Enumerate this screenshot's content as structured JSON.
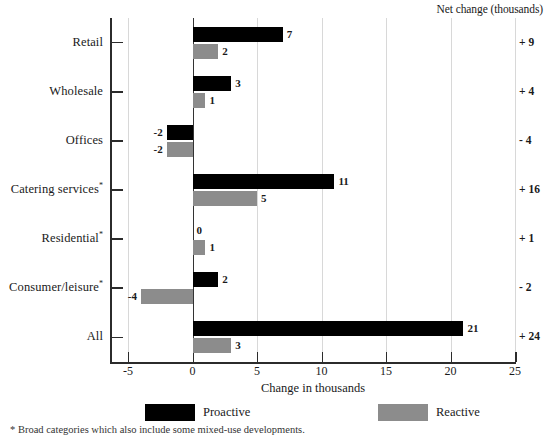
{
  "header": {
    "net_change_title": "Net change (thousands)"
  },
  "axis": {
    "x_title": "Change in thousands",
    "x_tick_labels": [
      "-5",
      "0",
      "5",
      "10",
      "15",
      "20",
      "25"
    ],
    "x_tick_values": [
      -5,
      0,
      5,
      10,
      15,
      20,
      25
    ],
    "x_min": -6.4,
    "x_max": 25
  },
  "legend": {
    "entries": [
      {
        "label": "Proactive",
        "color": "#000000",
        "key": "proactive"
      },
      {
        "label": "Reactive",
        "color": "#8c8c8c",
        "key": "reactive"
      }
    ]
  },
  "footnote": {
    "text": "* Broad categories which also include some mixed-use developments."
  },
  "categories": [
    {
      "label": "Retail",
      "footnote_marker": "",
      "net_change": "+ 9"
    },
    {
      "label": "Wholesale",
      "footnote_marker": "",
      "net_change": "+ 4"
    },
    {
      "label": "Offices",
      "footnote_marker": "",
      "net_change": "- 4"
    },
    {
      "label": "Catering services",
      "footnote_marker": "*",
      "net_change": "+ 16"
    },
    {
      "label": "Residential",
      "footnote_marker": "*",
      "net_change": "+ 1"
    },
    {
      "label": "Consumer/leisure",
      "footnote_marker": "*",
      "net_change": "- 2"
    },
    {
      "label": "All",
      "footnote_marker": "",
      "net_change": "+ 24"
    }
  ],
  "bar_labels": {
    "retail": {
      "proactive": "7",
      "reactive": "2"
    },
    "wholesale": {
      "proactive": "3",
      "reactive": "1"
    },
    "offices": {
      "proactive": "-2",
      "reactive": "-2"
    },
    "catering_services": {
      "proactive": "11",
      "reactive": "5"
    },
    "residential": {
      "proactive": "0",
      "reactive": "1"
    },
    "consumer_leisure": {
      "proactive": "2",
      "reactive": "-4"
    },
    "all": {
      "proactive": "21",
      "reactive": "3"
    }
  },
  "chart_data": {
    "type": "bar",
    "orientation": "horizontal",
    "title": "",
    "xlabel": "Change in thousands",
    "ylabel": "",
    "xlim": [
      -6.4,
      25
    ],
    "grid": true,
    "gridlines_at": [
      -5,
      5,
      10,
      15,
      20,
      25
    ],
    "zero_line": true,
    "legend_position": "bottom",
    "categories": [
      "Retail",
      "Wholesale",
      "Offices",
      "Catering services*",
      "Residential*",
      "Consumer/leisure*",
      "All"
    ],
    "series": [
      {
        "name": "Proactive",
        "color": "#000000",
        "values": [
          7,
          3,
          -2,
          11,
          0,
          2,
          21
        ]
      },
      {
        "name": "Reactive",
        "color": "#8c8c8c",
        "values": [
          2,
          1,
          -2,
          5,
          1,
          -4,
          3
        ]
      }
    ],
    "annotations": {
      "net_change_label": "Net change (thousands)",
      "net_change_values": [
        "+ 9",
        "+ 4",
        "- 4",
        "+ 16",
        "+ 1",
        "- 2",
        "+ 24"
      ]
    }
  }
}
